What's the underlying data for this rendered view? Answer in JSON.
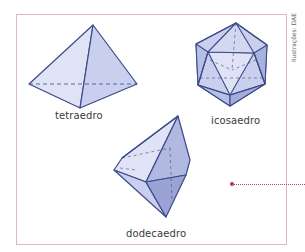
{
  "figure": {
    "frame_color": "#e4b4bf",
    "face_fill_light": "#dfe3f5",
    "face_fill_mid": "#c5cbea",
    "face_fill_dark": "#9aa3d4",
    "edge_color": "#3b4a8a",
    "polyhedra": [
      {
        "id": "tetrahedron",
        "label": "tetraedro"
      },
      {
        "id": "icosahedron",
        "label": "icosaedro"
      },
      {
        "id": "dodecahedron",
        "label": "dodecaedro"
      }
    ],
    "credit": "Ilustrações: DAE",
    "leader": {
      "color": "#a03a55"
    }
  }
}
